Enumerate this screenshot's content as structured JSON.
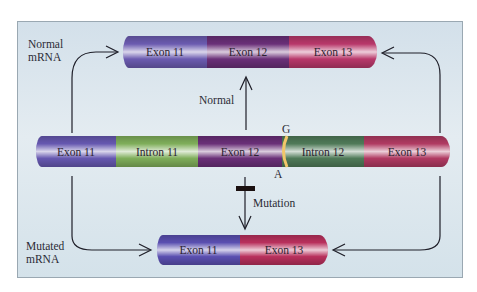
{
  "labels": {
    "normal_mrna": [
      "Normal",
      "mRNA"
    ],
    "mutated_mrna": [
      "Mutated",
      "mRNA"
    ],
    "normal_arrow": "Normal",
    "mutation_arrow": "Mutation",
    "site_top": "G",
    "site_bottom": "A"
  },
  "normal_mrna": [
    {
      "label": "Exon 11",
      "color": "#6b5bb0"
    },
    {
      "label": "Exon 12",
      "color": "#6a2f78"
    },
    {
      "label": "Exon 13",
      "color": "#b8386a"
    }
  ],
  "gene": [
    {
      "label": "Exon 11",
      "color": "#6658b0"
    },
    {
      "label": "Intron 11",
      "color": "#7fae5a"
    },
    {
      "label": "Exon 12",
      "color": "#6a2f78"
    },
    {
      "label": "Intron 12",
      "color": "#4f7a58"
    },
    {
      "label": "Exon 13",
      "color": "#b03a62"
    }
  ],
  "mutated_mrna": [
    {
      "label": "Exon 11",
      "color": "#5a4fb0"
    },
    {
      "label": "Exon 13",
      "color": "#b8305c"
    }
  ],
  "colors": {
    "splice_site": "#f2c66a",
    "arrow": "#1e1e28",
    "block": "#1a1010"
  }
}
